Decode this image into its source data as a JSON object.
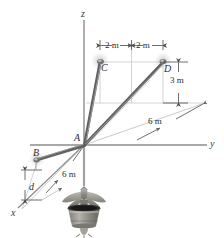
{
  "figure": {
    "axes": [
      {
        "name": "z",
        "label": "z"
      },
      {
        "name": "y",
        "label": "y"
      },
      {
        "name": "x",
        "label": "x"
      }
    ],
    "points": [
      {
        "name": "A",
        "label": "A"
      },
      {
        "name": "B",
        "label": "B"
      },
      {
        "name": "C",
        "label": "C"
      },
      {
        "name": "D",
        "label": "D"
      }
    ],
    "dimensions": [
      {
        "name": "c-to-center",
        "label": "2 m"
      },
      {
        "name": "center-to-d",
        "label": "2 m"
      },
      {
        "name": "height-3m",
        "label": "3 m"
      },
      {
        "name": "depth-6m-right",
        "label": "6 m"
      },
      {
        "name": "depth-6m-left",
        "label": "6 m"
      },
      {
        "name": "unknown-d",
        "label": "d"
      }
    ],
    "colors": {
      "line": "#8d8d8d",
      "cable": "#6f6f6f",
      "dim": "#4a4a4a",
      "construction": "#c3c3c3",
      "statue": "#9a9890",
      "background": "#ffffff"
    }
  }
}
